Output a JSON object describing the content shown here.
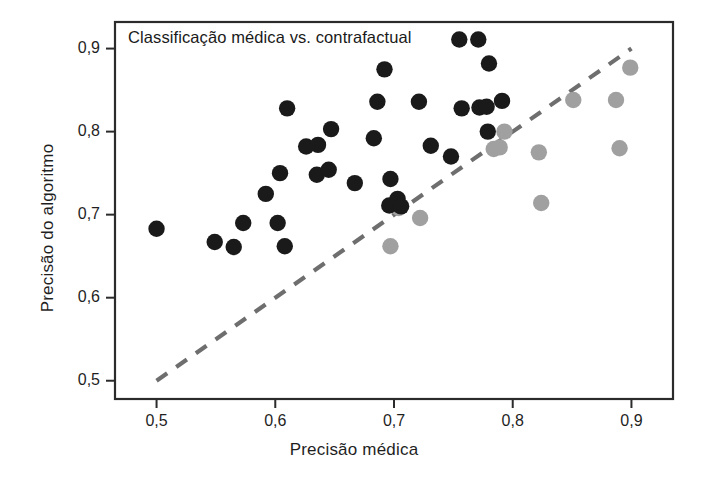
{
  "chart_data": {
    "type": "scatter",
    "title": "Classificação médica vs. contrafactual",
    "xlabel": "Precisão médica",
    "ylabel": "Precisão do algoritmo",
    "xlim": [
      0.465,
      0.935
    ],
    "ylim": [
      0.478,
      0.932
    ],
    "xticks": [
      "0,5",
      "0,6",
      "0,7",
      "0,8",
      "0,9"
    ],
    "xtick_values": [
      0.5,
      0.6,
      0.7,
      0.8,
      0.9
    ],
    "yticks": [
      "0,5",
      "0,6",
      "0,7",
      "0,8",
      "0,9"
    ],
    "ytick_values": [
      0.5,
      0.6,
      0.7,
      0.8,
      0.9
    ],
    "grid": false,
    "legend": "none",
    "decimal_separator": ",",
    "colors": {
      "dark_marker": "#1a1a1a",
      "light_marker": "#a0a0a0",
      "reference_line": "#6e6e6e",
      "axis": "#2b2b2b",
      "background": "#ffffff"
    },
    "reference_line": {
      "style": "dashed",
      "label": "identity line y = x",
      "x": [
        0.5,
        0.9
      ],
      "y": [
        0.5,
        0.9
      ]
    },
    "series": [
      {
        "name": "dark",
        "color": "#1a1a1a",
        "marker": "filled-circle",
        "points": [
          [
            0.5,
            0.683
          ],
          [
            0.549,
            0.667
          ],
          [
            0.565,
            0.661
          ],
          [
            0.573,
            0.69
          ],
          [
            0.592,
            0.725
          ],
          [
            0.602,
            0.69
          ],
          [
            0.604,
            0.75
          ],
          [
            0.608,
            0.662
          ],
          [
            0.61,
            0.828
          ],
          [
            0.626,
            0.782
          ],
          [
            0.635,
            0.748
          ],
          [
            0.636,
            0.784
          ],
          [
            0.645,
            0.754
          ],
          [
            0.647,
            0.803
          ],
          [
            0.667,
            0.738
          ],
          [
            0.683,
            0.792
          ],
          [
            0.686,
            0.836
          ],
          [
            0.692,
            0.875
          ],
          [
            0.696,
            0.711
          ],
          [
            0.697,
            0.743
          ],
          [
            0.703,
            0.719
          ],
          [
            0.706,
            0.71
          ],
          [
            0.721,
            0.836
          ],
          [
            0.731,
            0.783
          ],
          [
            0.748,
            0.77
          ],
          [
            0.755,
            0.911
          ],
          [
            0.757,
            0.828
          ],
          [
            0.771,
            0.911
          ],
          [
            0.772,
            0.829
          ],
          [
            0.778,
            0.83
          ],
          [
            0.779,
            0.8
          ],
          [
            0.78,
            0.882
          ],
          [
            0.791,
            0.837
          ]
        ]
      },
      {
        "name": "light",
        "color": "#a0a0a0",
        "marker": "filled-circle",
        "points": [
          [
            0.697,
            0.662
          ],
          [
            0.704,
            0.708
          ],
          [
            0.722,
            0.696
          ],
          [
            0.784,
            0.779
          ],
          [
            0.789,
            0.781
          ],
          [
            0.793,
            0.8
          ],
          [
            0.822,
            0.775
          ],
          [
            0.824,
            0.714
          ],
          [
            0.851,
            0.838
          ],
          [
            0.887,
            0.838
          ],
          [
            0.89,
            0.78
          ],
          [
            0.899,
            0.877
          ]
        ]
      }
    ]
  },
  "axes": {
    "frame": {
      "left_px": 115,
      "right_px": 673,
      "top_px": 22,
      "bottom_px": 399
    }
  }
}
